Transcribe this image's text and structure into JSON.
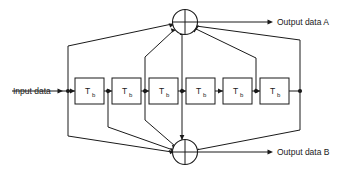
{
  "diagram": {
    "type": "block-diagram",
    "labels": {
      "input": "Input data",
      "output_a": "Output data A",
      "output_b": "Output data B"
    },
    "delay_blocks": [
      {
        "id": "d1",
        "main": "T",
        "sub": "b"
      },
      {
        "id": "d2",
        "main": "T",
        "sub": "b"
      },
      {
        "id": "d3",
        "main": "T",
        "sub": "b"
      },
      {
        "id": "d4",
        "main": "T",
        "sub": "b"
      },
      {
        "id": "d5",
        "main": "T",
        "sub": "b"
      },
      {
        "id": "d6",
        "main": "T",
        "sub": "b"
      }
    ],
    "adders": [
      {
        "id": "adder-a",
        "symbol": "+",
        "output": "Output data A"
      },
      {
        "id": "adder-b",
        "symbol": "+",
        "output": "Output data B"
      }
    ],
    "taps_to_adder_a": [
      "tap0",
      "tap2",
      "tap3",
      "tap5",
      "tap6"
    ],
    "taps_to_adder_b": [
      "tap0",
      "tap1",
      "tap2",
      "tap3",
      "tap6"
    ],
    "colors": {
      "line": "#1a1a1a",
      "background": "#ffffff",
      "block_fill": "#ffffff"
    }
  }
}
